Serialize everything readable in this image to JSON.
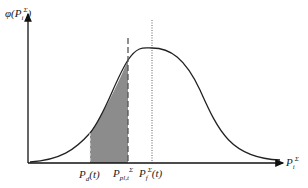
{
  "diagram": {
    "type": "probability-density-curve",
    "y_axis_label": {
      "base": "φ(P",
      "sub": "i",
      "sup": "Σ",
      "close": ")"
    },
    "x_axis_label": {
      "base": "P",
      "sub": "i",
      "sup": "Σ"
    },
    "markers": [
      {
        "base": "P",
        "sub": "d",
        "suffix": "(t)",
        "style": "dashed-boundary"
      },
      {
        "base": "P",
        "sub": "pl,t",
        "sup": "Σ",
        "style": "dashed-line"
      },
      {
        "base": "P",
        "sub": "f",
        "sup": "Σ",
        "suffix": "(t)",
        "style": "dotted-line"
      }
    ],
    "shaded_region": "between P_d(t) and P_pl,t^Σ",
    "colors": {
      "curve": "#222222",
      "shade": "#8c8c8c",
      "axis": "#111111"
    }
  }
}
